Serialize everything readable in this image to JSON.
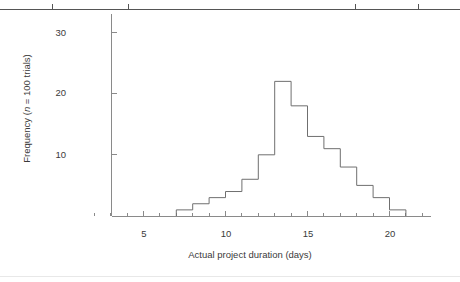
{
  "chart_data": {
    "type": "bar",
    "title": "",
    "subtitle": "",
    "xlabel": "Actual project duration (days)",
    "ylabel": "Frequency (n = 100 trials)",
    "ylabel_parts": {
      "prefix": "Frequency (",
      "italic_symbol": "n",
      "suffix": " = 100 trials)"
    },
    "style": "step histogram outline",
    "bin_width": 1,
    "categories": [
      7,
      8,
      9,
      10,
      11,
      12,
      13,
      14,
      15,
      16,
      17,
      18,
      19,
      20
    ],
    "bin_starts": [
      7,
      8,
      9,
      10,
      11,
      12,
      13,
      14,
      15,
      16,
      17,
      18,
      19,
      20
    ],
    "values": [
      1,
      2,
      3,
      4,
      6,
      10,
      22,
      18,
      13,
      11,
      8,
      5,
      3,
      1
    ],
    "series": [
      {
        "name": "Actual project duration",
        "values": [
          1,
          2,
          3,
          4,
          6,
          10,
          22,
          18,
          13,
          11,
          8,
          5,
          3,
          1
        ]
      }
    ],
    "xlim": [
      1,
      22.5
    ],
    "ylim": [
      0,
      33
    ],
    "xticks_major": [
      5,
      10,
      15,
      20
    ],
    "xtick_labels": [
      "5",
      "10",
      "15",
      "20"
    ],
    "xticks_minor": [
      2,
      3,
      4,
      6,
      7,
      8,
      9,
      11,
      12,
      13,
      14,
      16,
      17,
      18,
      19,
      21,
      22
    ],
    "yticks_major": [
      10,
      20,
      30
    ],
    "ytick_labels": [
      "10",
      "20",
      "30"
    ],
    "grid": false,
    "legend": false,
    "legend_position": "none",
    "annotations": [],
    "colors": {
      "line": "#6f6f6f",
      "axis": "#8a8a8a",
      "text": "#3a3a3a",
      "background": "#ffffff"
    }
  },
  "page_artifacts": {
    "top_rule": true,
    "bottom_rule": true,
    "ghost_text": ""
  }
}
